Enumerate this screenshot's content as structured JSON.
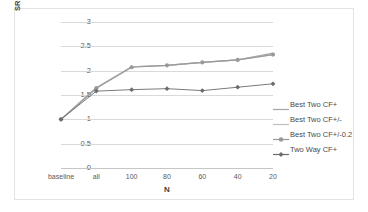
{
  "chart_data": {
    "type": "line",
    "title": "",
    "xlabel": "N",
    "ylabel": "SRI for Top N Candidates",
    "categories": [
      "baseline",
      "all",
      "100",
      "80",
      "60",
      "40",
      "20"
    ],
    "ylim": [
      0,
      3
    ],
    "yticks": [
      "0",
      "0.5",
      "1",
      "1.5",
      "2",
      "2.5",
      "3"
    ],
    "ytick_values": [
      0,
      0.5,
      1,
      1.5,
      2,
      2.5,
      3
    ],
    "grid": true,
    "legend_position": "right",
    "series": [
      {
        "name": "Best Two CF+",
        "color": "#a6a6a6",
        "marker": "none",
        "values": [
          1.0,
          1.65,
          2.08,
          2.11,
          2.17,
          2.22,
          2.36
        ]
      },
      {
        "name": "Best Two CF+/-",
        "color": "#bfbfbf",
        "marker": "none",
        "values": [
          1.0,
          1.65,
          2.08,
          2.11,
          2.17,
          2.22,
          2.33
        ]
      },
      {
        "name": "Best Two CF+/-0.2",
        "color": "#999999",
        "marker": "circle",
        "values": [
          1.0,
          1.64,
          2.07,
          2.11,
          2.17,
          2.22,
          2.33
        ]
      },
      {
        "name": "Two Way CF+",
        "color": "#6b6b6b",
        "marker": "diamond",
        "values": [
          1.0,
          1.58,
          1.61,
          1.63,
          1.59,
          1.66,
          1.73
        ]
      }
    ]
  },
  "legend": {
    "items": [
      {
        "label": "Best Two CF+"
      },
      {
        "label": "Best Two CF+/-"
      },
      {
        "label": "Best Two CF+/-0.2"
      },
      {
        "label": "Two Way CF+"
      }
    ]
  }
}
